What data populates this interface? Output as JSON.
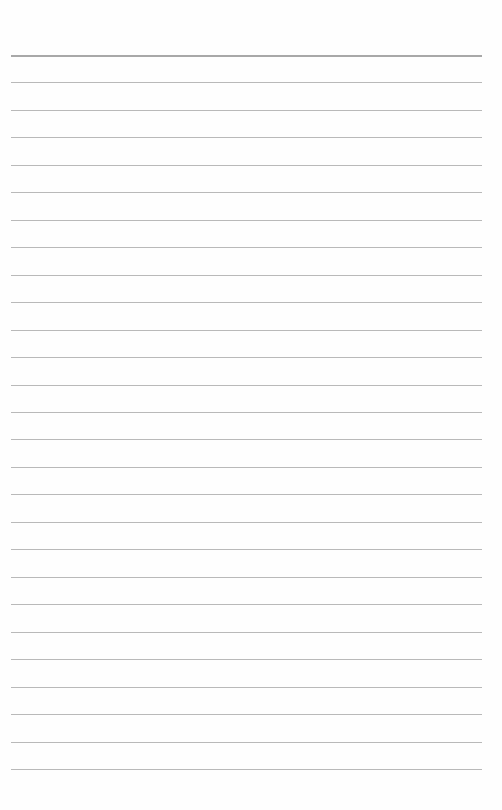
{
  "page": {
    "type": "blank-lined-paper",
    "rule_count": 27,
    "first_rule_y": 55,
    "rule_spacing": 27.46,
    "rule_left": 11,
    "rule_width": 471,
    "colors": {
      "paper": "#fefefe",
      "rule": "#b9b9b9",
      "top_rule": "#a8a8a8"
    }
  }
}
